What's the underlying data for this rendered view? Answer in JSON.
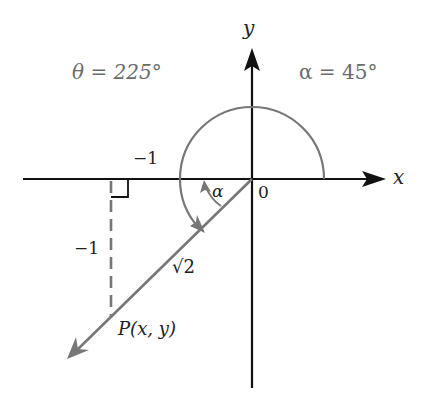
{
  "diagram": {
    "title_left": "θ = 225°",
    "title_right": "α = 45°",
    "axis_labels": {
      "x": "x",
      "y": "y",
      "origin": "0"
    },
    "segment_labels": {
      "horizontal_leg": "−1",
      "vertical_leg": "−1",
      "hypotenuse": "√2",
      "alpha": "α"
    },
    "point_label": "P(x, y)",
    "colors": {
      "axis": "#111111",
      "angle_arc": "#777777",
      "ray": "#777777",
      "dashed": "#777777",
      "label_gray": "#6b6b6b",
      "label_dark": "#222222"
    },
    "angles": {
      "theta_deg": 225,
      "alpha_deg": 45
    }
  }
}
